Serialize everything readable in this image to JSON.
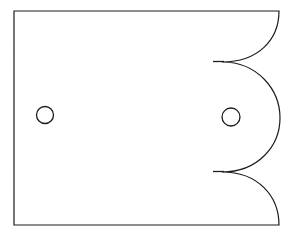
{
  "figure": {
    "kind": "line-drawing",
    "background_color": "#ffffff",
    "stroke_color": "#1c1c1c",
    "stroke_width": 1.2,
    "canvas": {
      "width": 293,
      "height": 238
    }
  },
  "geometry": {
    "body": {
      "name": "scalloped-plate-outline",
      "left_x": 14,
      "right_x": 279,
      "top_y": 11,
      "bottom_y": 225,
      "scallop_cusp_top": {
        "x": 222,
        "y": 62
      },
      "scallop_cusp_bottom": {
        "x": 222,
        "y": 172
      },
      "middle_bulge_max_x": 280,
      "path": "M 14 11 L 279 11 C 279 40 258 62 222 62 C 258 62 280 90 280 118 C 280 146 258 172 222 172 C 258 172 279 196 279 225 L 14 225 Z"
    },
    "holes": [
      {
        "name": "left-hole",
        "cx": 45,
        "cy": 115,
        "r": 8.5
      },
      {
        "name": "right-hole",
        "cx": 231,
        "cy": 117,
        "r": 9.0
      }
    ],
    "cusp_ticks": [
      {
        "name": "top-cusp-tick",
        "x1": 213,
        "y1": 61.5,
        "x2": 224,
        "y2": 61.5
      },
      {
        "name": "bottom-cusp-tick",
        "x1": 213,
        "y1": 171.5,
        "x2": 224,
        "y2": 171.5
      }
    ]
  },
  "labels": {
    "none": ""
  }
}
